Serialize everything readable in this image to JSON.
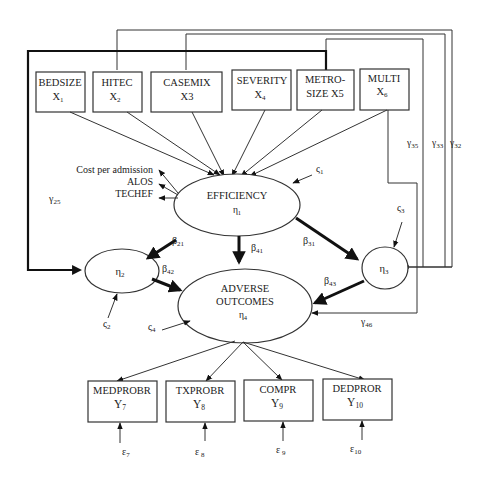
{
  "diagram": {
    "type": "structural-equation-model",
    "exogenous": [
      {
        "id": "x1",
        "name": "BEDSIZE",
        "sub": "X",
        "idx": "1"
      },
      {
        "id": "x2",
        "name": "HITEC",
        "sub": "X",
        "idx": "2"
      },
      {
        "id": "x3",
        "name": "CASEMIX",
        "sub": "X3",
        "idx": ""
      },
      {
        "id": "x4",
        "name": "SEVERITY",
        "sub": "X",
        "idx": "4"
      },
      {
        "id": "x5",
        "name": "METRO-",
        "name2": "SIZE  X5"
      },
      {
        "id": "x6",
        "name": "MULTI",
        "sub": "X",
        "idx": "6"
      }
    ],
    "latent": {
      "eta1": {
        "name": "EFFICIENCY",
        "sym": "η",
        "idx": "1"
      },
      "eta2": {
        "sym": "η",
        "idx": "2"
      },
      "eta3": {
        "sym": "η",
        "idx": "3"
      },
      "eta4": {
        "name": "ADVERSE",
        "name2": "OUTCOMES",
        "sym": "η",
        "idx": "4"
      }
    },
    "efficiency_indicators": [
      "Cost per admission",
      "ALOS",
      "TECHEF"
    ],
    "endogenous_indicators": [
      {
        "id": "y7",
        "name": "MEDPROBR",
        "sym": "Y",
        "idx": "7",
        "err": "ε",
        "err_idx": "7"
      },
      {
        "id": "y8",
        "name": "TXPROBR",
        "sym": "Y",
        "idx": "8",
        "err": "ε",
        "err_idx": " 8"
      },
      {
        "id": "y9",
        "name": "COMPR",
        "sym": "Y",
        "idx": "9",
        "err": "ε",
        "err_idx": " 9"
      },
      {
        "id": "y10",
        "name": "DEDPROR",
        "sym": "Y",
        "idx": "10",
        "err": "ε",
        "err_idx": "10"
      }
    ],
    "disturbances": {
      "z1": {
        "sym": "ς",
        "idx": "1"
      },
      "z2": {
        "sym": "ς",
        "idx": "2"
      },
      "z3": {
        "sym": "ς",
        "idx": "3"
      },
      "z4": {
        "sym": "ς",
        "idx": "4"
      }
    },
    "paths": {
      "b21": {
        "sym": "β",
        "idx": "21"
      },
      "b31": {
        "sym": "β",
        "idx": "31"
      },
      "b41": {
        "sym": "β",
        "idx": "41"
      },
      "b42": {
        "sym": "β",
        "idx": "42"
      },
      "b43": {
        "sym": "β",
        "idx": "43"
      },
      "g25": {
        "sym": "γ",
        "idx": "25"
      },
      "g35": {
        "sym": "γ",
        "idx": "35"
      },
      "g33": {
        "sym": "γ",
        "idx": "33"
      },
      "g32": {
        "sym": "γ",
        "idx": "32"
      },
      "g46": {
        "sym": "γ",
        "idx": "46"
      }
    }
  }
}
